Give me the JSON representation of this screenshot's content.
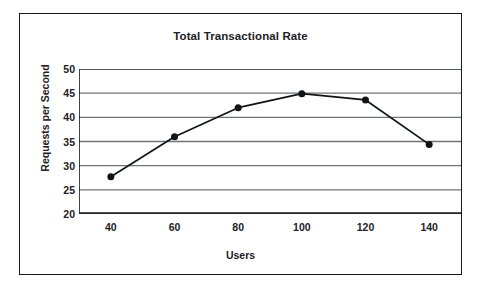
{
  "chart_data": {
    "type": "line",
    "title": "Total Transactional Rate",
    "xlabel": "Users",
    "ylabel": "Requests per Second",
    "x": [
      40,
      60,
      80,
      100,
      120,
      140
    ],
    "values": [
      27.7,
      36.0,
      42.0,
      44.9,
      43.6,
      34.4
    ],
    "series": [
      {
        "name": "Total Transactional Rate",
        "values": [
          27.7,
          36.0,
          42.0,
          44.9,
          43.6,
          34.4
        ]
      }
    ],
    "xlim": [
      30,
      150
    ],
    "ylim": [
      20,
      50
    ],
    "x_ticks": [
      "40",
      "60",
      "80",
      "100",
      "120",
      "140"
    ],
    "y_ticks": [
      "50",
      "45",
      "40",
      "35",
      "30",
      "25",
      "20"
    ],
    "y_tick_values": [
      50,
      45,
      40,
      35,
      30,
      25,
      20
    ],
    "grid": "horizontal",
    "legend": "none",
    "marker": "filled-circle",
    "line_color": "#111417",
    "marker_color": "#111417",
    "grid_color": "#6f7479",
    "axis_color": "#1d2126",
    "frame_color": "#15181c",
    "background": "#ffffff"
  }
}
